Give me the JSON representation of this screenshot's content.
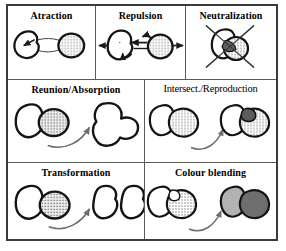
{
  "figure": {
    "background_color": "#ffffff",
    "frame_color": "#3a3a3a",
    "divider_color": "#5a5a5a",
    "ink_color": "#1a1a1a",
    "grid": {
      "rows": 3,
      "cells_row1": 3,
      "cells_row2": 2,
      "cells_row3": 2
    }
  },
  "palette": {
    "outline": "#141414",
    "white_fill": "#ffffff",
    "stipple_fill": "#c9c9c9",
    "dark_gray_fill": "#6a6a6a",
    "mid_gray_fill": "#9a9a9a",
    "light_gray_fill": "#b5b5b5",
    "arrow_gray": "#6d6d6d"
  },
  "panels": [
    {
      "id": "attraction",
      "title": "Atraction",
      "title_style": "bold",
      "row": 1,
      "col": 1,
      "description": "White blob on the left joined by a lens-shaped link to a stippled grey disc on the right, with an arrow pointing left into the white blob.",
      "operands": [
        "white-blob",
        "stippled-disc"
      ],
      "result": "joined-pair",
      "arrows": [
        "left-arrow-into-white-blob"
      ]
    },
    {
      "id": "repulsion",
      "title": "Repulsion",
      "title_style": "bold",
      "row": 1,
      "col": 2,
      "description": "White blob and stippled disc moving apart; outward arrows at both far sides and short arrows between them.",
      "operands": [
        "white-blob",
        "stippled-disc"
      ],
      "result": "separated-pair",
      "arrows": [
        "far-left-arrow",
        "far-right-arrow",
        "inner-left-arrow",
        "inner-right-arrow",
        "curl-arrow"
      ]
    },
    {
      "id": "neutralization",
      "title": "Neutralization",
      "title_style": "bold",
      "row": 1,
      "col": 3,
      "description": "Two overlapping blobs with a dark grey intersection, struck through by a large X.",
      "operands": [
        "white-blob",
        "stippled-disc"
      ],
      "result": "cancelled-pair",
      "arrows": []
    },
    {
      "id": "reunion-absorption",
      "title": "Reunion/Absorption",
      "title_style": "bold",
      "row": 2,
      "col": 1,
      "description": "White blob overlapping a stippled disc transforms, via a curved arrow, into one single merged white blob.",
      "operands": [
        "white-blob",
        "stippled-disc"
      ],
      "result": "single-merged-white-blob",
      "arrows": [
        "curved-transform-arrow"
      ]
    },
    {
      "id": "intersect-reproduction",
      "title": "Intersect./Reproduction",
      "title_style": "thin",
      "row": 2,
      "col": 2,
      "description": "White blob overlapping a stippled blob becomes a white blob plus stippled blob with a new dark grey offspring blob in the overlap.",
      "operands": [
        "white-blob",
        "stippled-blob"
      ],
      "result": "white-blob-stippled-blob-with-dark-offspring",
      "arrows": [
        "curved-transform-arrow"
      ]
    },
    {
      "id": "transformation",
      "title": "Transformation",
      "title_style": "bold",
      "row": 3,
      "col": 1,
      "description": "White blob overlapping a stippled disc becomes two separate white kidney-shaped blobs.",
      "operands": [
        "white-blob",
        "stippled-disc"
      ],
      "result": "two-white-kidney-blobs",
      "arrows": [
        "curved-transform-arrow"
      ]
    },
    {
      "id": "colour-blending",
      "title": "Colour blending",
      "title_style": "bold",
      "row": 3,
      "col": 2,
      "description": "White blob overlapping a stippled blob becomes a light grey blob overlapping a dark grey blob.",
      "operands": [
        "white-blob",
        "stippled-blob"
      ],
      "result": "light-grey-blob-over-dark-grey-blob",
      "arrows": [
        "curved-transform-arrow"
      ]
    }
  ]
}
